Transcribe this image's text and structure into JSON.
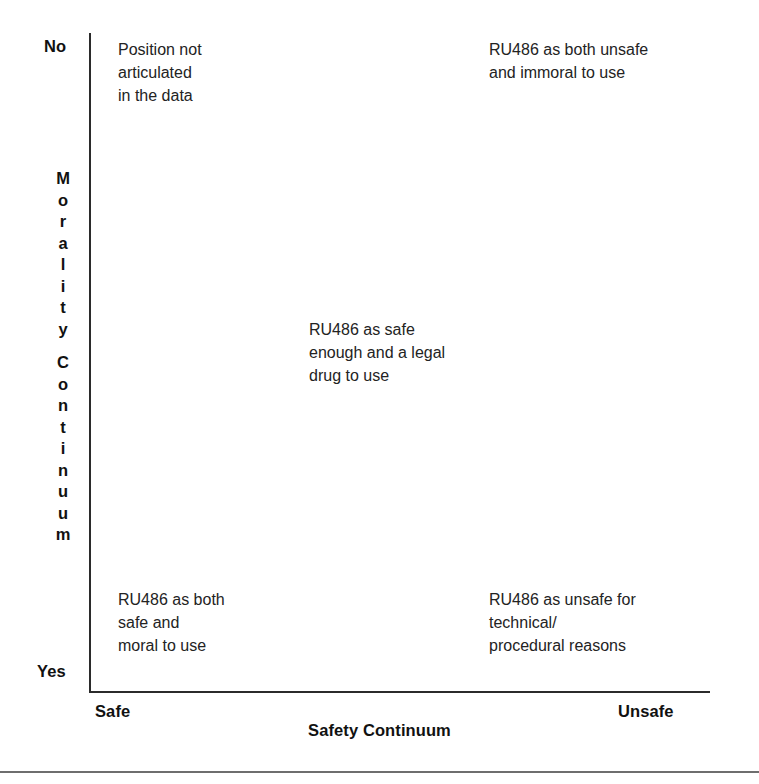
{
  "figure": {
    "type": "quadrant-matrix",
    "caption_rule_visible": true
  },
  "axes": {
    "y": {
      "title": "Morality Continuum",
      "title_words": [
        "Morality",
        "Continuum"
      ],
      "top_label": "No",
      "bottom_label": "Yes"
    },
    "x": {
      "title": "Safety Continuum",
      "left_label": "Safe",
      "right_label": "Unsafe"
    }
  },
  "cells": {
    "top_left": "Position not\narticulated\nin the data",
    "top_right": "RU486 as both unsafe\nand immoral to use",
    "center": "RU486 as safe\nenough and a legal\ndrug to use",
    "bottom_left": "RU486 as both\nsafe and\nmoral to use",
    "bottom_right": "RU486 as unsafe for\ntechnical/\nprocedural reasons"
  },
  "chart_data": {
    "type": "scatter",
    "title": "",
    "xlabel": "Safety Continuum",
    "ylabel": "Morality Continuum",
    "xlim": [
      "Safe",
      "Unsafe"
    ],
    "ylim": [
      "Yes",
      "No"
    ],
    "grid": false,
    "legend": "none",
    "annotations": [
      {
        "text": "Position not articulated in the data",
        "x": "Safe",
        "y": "No",
        "quadrant": "top-left",
        "x_frac": 0.05,
        "y_frac": 1.0
      },
      {
        "text": "RU486 as both unsafe and immoral to use",
        "x": "Unsafe",
        "y": "No",
        "quadrant": "top-right",
        "x_frac": 0.64,
        "y_frac": 1.0
      },
      {
        "text": "RU486 as safe enough and a legal drug to use",
        "x": "Middle",
        "y": "Middle",
        "quadrant": "center",
        "x_frac": 0.35,
        "y_frac": 0.56
      },
      {
        "text": "RU486 as both safe and moral to use",
        "x": "Safe",
        "y": "Yes",
        "quadrant": "bottom-left",
        "x_frac": 0.05,
        "y_frac": 0.15
      },
      {
        "text": "RU486 as unsafe for technical/ procedural reasons",
        "x": "Unsafe",
        "y": "Yes",
        "quadrant": "bottom-right",
        "x_frac": 0.64,
        "y_frac": 0.15
      }
    ]
  }
}
